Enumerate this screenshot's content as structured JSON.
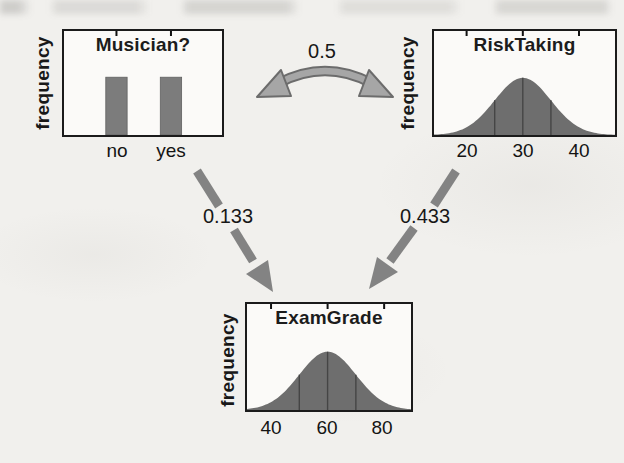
{
  "colors": {
    "arrow": "#838383",
    "curved_arrow_fill": "#a6a6a6",
    "curved_arrow_outline": "#6c6c6c",
    "ink": "#1b1b1b",
    "paper": "#f1f0ed"
  },
  "diagram": {
    "nodes": [
      "Musician?",
      "RiskTaking",
      "ExamGrade"
    ],
    "edges": [
      {
        "from": "Musician?",
        "to": "RiskTaking",
        "label": "0.5",
        "style": "curved-double-headed"
      },
      {
        "from": "Musician?",
        "to": "ExamGrade",
        "label": "0.133",
        "style": "straight-arrow"
      },
      {
        "from": "RiskTaking",
        "to": "ExamGrade",
        "label": "0.433",
        "style": "straight-arrow"
      }
    ]
  },
  "chart_data": [
    {
      "id": "musician",
      "type": "bar",
      "title": "Musician?",
      "ylabel": "frequency",
      "categories": [
        "no",
        "yes"
      ],
      "values": [
        0.5,
        0.5
      ],
      "ylim": [
        0,
        0.9
      ],
      "bar_color": "#7c7c7c"
    },
    {
      "id": "risktaking",
      "type": "area",
      "title": "RiskTaking",
      "ylabel": "frequency",
      "xticks": [
        20,
        30,
        40
      ],
      "xtick_labels": [
        "20",
        "30",
        "40"
      ],
      "mean": 30,
      "sd": 5,
      "gridlines": [
        25,
        30,
        35
      ],
      "xlim": [
        14.2,
        46.4
      ],
      "peak_fraction": 0.55,
      "fill_color": "#6e6e6e",
      "gridline_color": "#454545"
    },
    {
      "id": "examgrade",
      "type": "area",
      "title": "ExamGrade",
      "ylabel": "frequency",
      "xticks": [
        40,
        60,
        80
      ],
      "xtick_labels": [
        "40",
        "60",
        "80"
      ],
      "mean": 60,
      "sd": 10,
      "gridlines": [
        50,
        60,
        70
      ],
      "xlim": [
        31.5,
        89.5
      ],
      "peak_fraction": 0.55,
      "fill_color": "#6e6e6e",
      "gridline_color": "#454545"
    }
  ]
}
